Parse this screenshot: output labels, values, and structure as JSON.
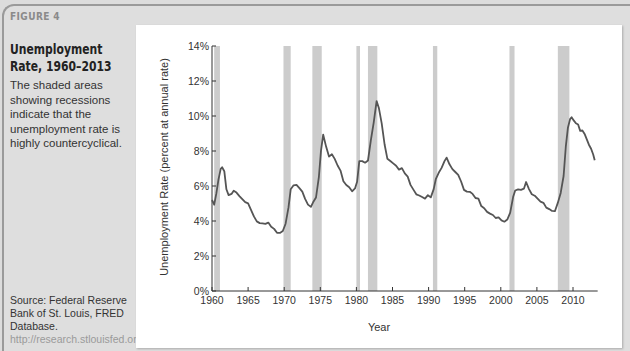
{
  "figure": {
    "label": "FIGURE 4",
    "title": "Unemployment Rate, 1960–2013",
    "caption": "The shaded areas showing recessions indicate that the unemployment rate is highly countercyclical.",
    "source_text": "Source: Federal Reserve Bank of St. Louis, FRED Database. ",
    "source_url": "http://research.stlouisfed.org/fred2/"
  },
  "colors": {
    "line": "#555555",
    "recession": "#cccccc",
    "axis": "#333333"
  },
  "chart_data": {
    "type": "line",
    "title": "Unemployment Rate, 1960–2013",
    "xlabel": "Year",
    "ylabel": "Unemployment Rate (percent at annual rate)",
    "xlim": [
      1960,
      2013
    ],
    "ylim": [
      0,
      14
    ],
    "x_ticks": [
      1960,
      1965,
      1970,
      1975,
      1980,
      1985,
      1990,
      1995,
      2000,
      2005,
      2010
    ],
    "y_ticks": [
      "0%",
      "2%",
      "4%",
      "6%",
      "8%",
      "10%",
      "12%",
      "14%"
    ],
    "grid": false,
    "legend": null,
    "recessions": [
      [
        1960.3,
        1961.1
      ],
      [
        1969.9,
        1970.9
      ],
      [
        1973.9,
        1975.2
      ],
      [
        1980.0,
        1980.5
      ],
      [
        1981.6,
        1982.9
      ],
      [
        1990.6,
        1991.2
      ],
      [
        2001.2,
        2001.9
      ],
      [
        2007.9,
        2009.5
      ]
    ],
    "series": [
      {
        "name": "Unemployment rate",
        "x": [
          1960.0,
          1960.3,
          1960.6,
          1960.9,
          1961.2,
          1961.4,
          1961.7,
          1962.0,
          1962.3,
          1962.7,
          1963.0,
          1963.4,
          1963.8,
          1964.2,
          1964.6,
          1965.0,
          1965.4,
          1965.8,
          1966.2,
          1966.6,
          1967.0,
          1967.4,
          1967.8,
          1968.2,
          1968.6,
          1969.0,
          1969.4,
          1969.8,
          1970.2,
          1970.6,
          1970.9,
          1971.3,
          1971.7,
          1972.1,
          1972.5,
          1972.9,
          1973.3,
          1973.7,
          1974.0,
          1974.4,
          1974.8,
          1975.1,
          1975.4,
          1975.8,
          1976.2,
          1976.6,
          1977.0,
          1977.4,
          1977.8,
          1978.2,
          1978.6,
          1979.0,
          1979.4,
          1979.8,
          1980.1,
          1980.4,
          1980.8,
          1981.2,
          1981.6,
          1982.0,
          1982.4,
          1982.8,
          1983.1,
          1983.5,
          1983.9,
          1984.3,
          1984.7,
          1985.1,
          1985.5,
          1985.9,
          1986.3,
          1986.7,
          1987.1,
          1987.5,
          1987.9,
          1988.3,
          1988.7,
          1989.1,
          1989.5,
          1989.9,
          1990.3,
          1990.7,
          1991.0,
          1991.4,
          1991.8,
          1992.2,
          1992.5,
          1992.9,
          1993.3,
          1993.7,
          1994.1,
          1994.5,
          1994.9,
          1995.3,
          1995.7,
          1996.1,
          1996.5,
          1996.9,
          1997.3,
          1997.7,
          1998.1,
          1998.5,
          1998.9,
          1999.3,
          1999.7,
          2000.1,
          2000.5,
          2000.9,
          2001.3,
          2001.7,
          2002.0,
          2002.4,
          2002.8,
          2003.2,
          2003.5,
          2003.9,
          2004.3,
          2004.7,
          2005.1,
          2005.5,
          2005.9,
          2006.3,
          2006.7,
          2007.1,
          2007.5,
          2007.9,
          2008.3,
          2008.7,
          2009.0,
          2009.3,
          2009.6,
          2009.8,
          2010.1,
          2010.4,
          2010.7,
          2011.0,
          2011.3,
          2011.6,
          2011.9,
          2012.2,
          2012.5,
          2012.8,
          2013.0
        ],
        "y": [
          5.2,
          4.9,
          5.5,
          6.3,
          6.9,
          7.0,
          6.8,
          5.8,
          5.5,
          5.6,
          5.8,
          5.7,
          5.5,
          5.3,
          5.1,
          5.0,
          4.6,
          4.2,
          3.9,
          3.8,
          3.8,
          3.8,
          3.9,
          3.7,
          3.6,
          3.4,
          3.4,
          3.5,
          3.9,
          4.8,
          5.8,
          6.0,
          6.0,
          5.8,
          5.6,
          5.2,
          4.9,
          4.8,
          5.1,
          5.4,
          6.6,
          8.1,
          9.0,
          8.3,
          7.7,
          7.8,
          7.5,
          7.1,
          6.8,
          6.2,
          6.0,
          5.9,
          5.7,
          5.9,
          6.3,
          7.5,
          7.5,
          7.4,
          7.5,
          8.6,
          9.6,
          10.8,
          10.4,
          9.5,
          8.3,
          7.5,
          7.4,
          7.3,
          7.2,
          7.0,
          7.1,
          6.8,
          6.6,
          6.1,
          5.8,
          5.5,
          5.4,
          5.3,
          5.2,
          5.4,
          5.3,
          5.8,
          6.4,
          6.8,
          7.1,
          7.5,
          7.7,
          7.3,
          7.0,
          6.8,
          6.6,
          6.2,
          5.7,
          5.6,
          5.6,
          5.5,
          5.3,
          5.3,
          4.9,
          4.8,
          4.6,
          4.5,
          4.4,
          4.2,
          4.2,
          4.0,
          3.9,
          4.0,
          4.4,
          5.3,
          5.7,
          5.8,
          5.8,
          5.9,
          6.3,
          5.9,
          5.6,
          5.5,
          5.3,
          5.1,
          5.0,
          4.7,
          4.6,
          4.5,
          4.5,
          5.0,
          5.6,
          6.6,
          8.3,
          9.4,
          9.9,
          10.0,
          9.8,
          9.6,
          9.5,
          9.1,
          9.1,
          8.9,
          8.6,
          8.3,
          8.1,
          7.8,
          7.5
        ]
      }
    ]
  }
}
